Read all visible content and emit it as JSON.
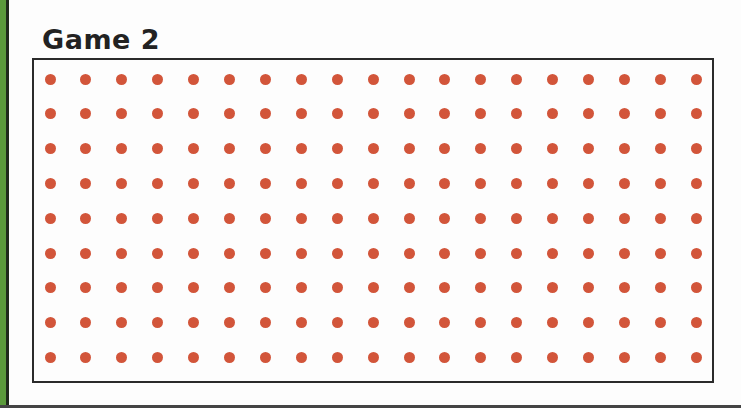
{
  "title": "Game 2",
  "board": {
    "rows": 9,
    "cols": 19,
    "dot_color": "#d2553a",
    "first_x": 50,
    "first_y": 79,
    "step_x": 35.9,
    "step_y": 34.8
  }
}
